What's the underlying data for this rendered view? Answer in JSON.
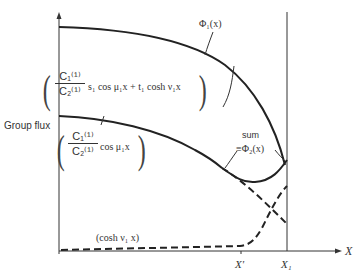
{
  "figure": {
    "y_axis_label": "Group flux",
    "x_axis_label": "X",
    "x_ticks": [
      "X'",
      "X₁"
    ],
    "curves": [
      {
        "name": "phi1",
        "label": "Φ₁(x)",
        "style": "solid"
      },
      {
        "name": "cos-component-upper",
        "expression": "(C₁⁽¹⁾ / C₂⁽¹⁾ s₁ cos μ₁x + t₁ cosh ν₁x)"
      },
      {
        "name": "cos-component",
        "expression": "(C₁⁽¹⁾ / C₂⁽¹⁾ cos μ₁x)",
        "style": "solid then dashed"
      },
      {
        "name": "cosh-component",
        "expression": "(cosh ν₁ x)",
        "style": "dashed"
      },
      {
        "name": "sum",
        "label_line1": "sum",
        "label_line2": "≡Φ₂(x)",
        "style": "solid"
      }
    ],
    "labels": {
      "phi1": "Φ₁(x)",
      "frac1_num": "C₁⁽¹⁾",
      "frac1_den": "C₂⁽¹⁾",
      "expr1_tail": "s₁ cos μ₁x + t₁ cosh ν₁x",
      "frac2_num": "C₁⁽¹⁾",
      "frac2_den": "C₂⁽¹⁾",
      "expr2_tail": "cos μ₁x",
      "cosh": "(cosh ν₁ x)",
      "sum": "sum",
      "phi2": "≡Φ₂(x)",
      "x_prime": "X'",
      "x1": "X₁",
      "x_axis": "X",
      "y_axis": "Group flux"
    }
  }
}
